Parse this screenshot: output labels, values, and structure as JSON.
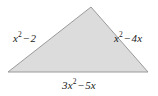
{
  "figure": {
    "shape": "triangle",
    "background_color": "#ffffff",
    "fill_color": "#dcdcdc",
    "stroke_color": "#9a9a9a",
    "vertices": {
      "apex": [
        91,
        7
      ],
      "bottom_left": [
        8,
        72
      ],
      "bottom_right": [
        148,
        72
      ]
    },
    "labels": {
      "left_side": {
        "coefficient": "x",
        "exponent": "2",
        "operator": "−",
        "term": "2",
        "full": "x² − 2"
      },
      "right_side": {
        "coefficient": "x",
        "exponent": "2",
        "operator": "−",
        "term": "4x",
        "full": "x² − 4x"
      },
      "base": {
        "coefficient": "3x",
        "exponent": "2",
        "operator": "−",
        "term": "5x",
        "full": "3x² − 5x"
      }
    }
  }
}
